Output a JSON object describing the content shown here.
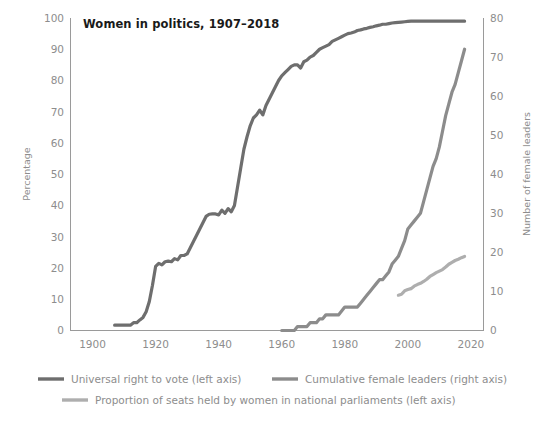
{
  "chart_data": {
    "type": "line",
    "title": "Women in politics, 1907–2018",
    "xlabel": "",
    "ylabel": "Percentage",
    "y2label": "Number of female leaders",
    "xlim": [
      1893,
      2024
    ],
    "ylim": [
      0,
      100
    ],
    "y2lim": [
      0,
      80
    ],
    "xticks": [
      1900,
      1920,
      1940,
      1960,
      1980,
      2000,
      2020
    ],
    "xtick_labels": [
      "1900",
      "1920",
      "1940",
      "1960",
      "1980",
      "2000",
      "2020"
    ],
    "yticks": [
      0,
      10,
      20,
      30,
      40,
      50,
      60,
      70,
      80,
      90,
      100
    ],
    "ytick_labels": [
      "0",
      "10",
      "20",
      "30",
      "40",
      "50",
      "60",
      "70",
      "80",
      "90",
      "100"
    ],
    "y2ticks": [
      0,
      10,
      20,
      30,
      40,
      50,
      60,
      70,
      80
    ],
    "y2tick_labels": [
      "0",
      "10",
      "20",
      "30",
      "40",
      "50",
      "60",
      "70",
      "80"
    ],
    "grid": false,
    "legend_position": "bottom",
    "series": [
      {
        "name": "Universal right to vote (left axis)",
        "axis": "left",
        "color": "#6e6e6e",
        "unit": "percent",
        "x": [
          1907,
          1908,
          1909,
          1910,
          1911,
          1912,
          1913,
          1914,
          1915,
          1916,
          1917,
          1918,
          1919,
          1920,
          1921,
          1922,
          1923,
          1924,
          1925,
          1926,
          1927,
          1928,
          1929,
          1930,
          1931,
          1932,
          1933,
          1934,
          1935,
          1936,
          1937,
          1938,
          1939,
          1940,
          1941,
          1942,
          1943,
          1944,
          1945,
          1946,
          1947,
          1948,
          1949,
          1950,
          1951,
          1952,
          1953,
          1954,
          1955,
          1956,
          1957,
          1958,
          1959,
          1960,
          1961,
          1962,
          1963,
          1964,
          1965,
          1966,
          1967,
          1968,
          1969,
          1970,
          1971,
          1972,
          1973,
          1974,
          1975,
          1976,
          1977,
          1978,
          1979,
          1980,
          1981,
          1982,
          1983,
          1984,
          1985,
          1986,
          1987,
          1988,
          1989,
          1990,
          1991,
          1992,
          1993,
          1994,
          1995,
          1996,
          1997,
          1998,
          1999,
          2000,
          2001,
          2002,
          2003,
          2004,
          2005,
          2006,
          2007,
          2008,
          2009,
          2010,
          2011,
          2012,
          2013,
          2014,
          2015,
          2016,
          2017,
          2018
        ],
        "y": [
          1.7,
          1.7,
          1.7,
          1.7,
          1.7,
          1.7,
          2.5,
          2.5,
          3.4,
          4.2,
          6.0,
          9.3,
          14.5,
          20.5,
          21.5,
          21.0,
          22.0,
          22.2,
          22.0,
          23.0,
          22.6,
          24.0,
          24.0,
          24.5,
          26.5,
          28.5,
          30.5,
          32.5,
          34.5,
          36.5,
          37.2,
          37.3,
          37.3,
          37.0,
          38.5,
          37.5,
          39.0,
          38.0,
          40.0,
          46.0,
          52.0,
          58.0,
          62.0,
          65.5,
          68.0,
          69.0,
          70.5,
          69.0,
          72.0,
          74.0,
          76.0,
          78.0,
          80.0,
          81.5,
          82.5,
          83.5,
          84.5,
          85.0,
          85.0,
          84.0,
          86.0,
          86.5,
          87.5,
          88.0,
          89.0,
          90.0,
          90.5,
          91.0,
          91.5,
          92.5,
          93.0,
          93.5,
          94.0,
          94.5,
          95.0,
          95.2,
          95.5,
          96.0,
          96.2,
          96.5,
          96.7,
          97.0,
          97.2,
          97.5,
          97.7,
          98.0,
          98.0,
          98.2,
          98.4,
          98.5,
          98.6,
          98.7,
          98.8,
          98.9,
          99.0,
          99.0,
          99.0,
          99.0,
          99.0,
          99.0,
          99.0,
          99.0,
          99.0,
          99.0,
          99.0,
          99.0,
          99.0,
          99.0,
          99.0,
          99.0,
          99.0,
          99.0
        ]
      },
      {
        "name": "Cumulative female leaders (right axis)",
        "axis": "right",
        "color": "#8c8c8c",
        "unit": "count",
        "x": [
          1960,
          1961,
          1962,
          1963,
          1964,
          1965,
          1966,
          1967,
          1968,
          1969,
          1970,
          1971,
          1972,
          1973,
          1974,
          1975,
          1976,
          1977,
          1978,
          1979,
          1980,
          1981,
          1982,
          1983,
          1984,
          1985,
          1986,
          1987,
          1988,
          1989,
          1990,
          1991,
          1992,
          1993,
          1994,
          1995,
          1996,
          1997,
          1998,
          1999,
          2000,
          2001,
          2002,
          2003,
          2004,
          2005,
          2006,
          2007,
          2008,
          2009,
          2010,
          2011,
          2012,
          2013,
          2014,
          2015,
          2016,
          2017,
          2018
        ],
        "y": [
          0,
          0,
          0,
          0,
          0,
          1,
          1,
          1,
          1,
          2,
          2,
          2,
          3,
          3,
          4,
          4,
          4,
          4,
          4,
          5,
          6,
          6,
          6,
          6,
          6,
          7,
          8,
          9,
          10,
          11,
          12,
          13,
          13,
          14,
          15,
          17,
          18,
          19,
          21,
          23,
          26,
          27,
          28,
          29,
          30,
          33,
          36,
          39,
          42,
          44,
          47,
          51,
          55,
          58,
          61,
          63,
          66,
          69,
          72
        ]
      },
      {
        "name": "Proportion of seats held by women in national parliaments (left axis)",
        "axis": "left",
        "color": "#aeaeae",
        "unit": "percent",
        "x": [
          1997,
          1998,
          1999,
          2000,
          2001,
          2002,
          2003,
          2004,
          2005,
          2006,
          2007,
          2008,
          2009,
          2010,
          2011,
          2012,
          2013,
          2014,
          2015,
          2016,
          2017,
          2018
        ],
        "y": [
          11.3,
          11.6,
          12.7,
          13.1,
          13.4,
          14.2,
          14.7,
          15.1,
          15.7,
          16.4,
          17.3,
          17.9,
          18.5,
          19.0,
          19.5,
          20.3,
          21.2,
          21.8,
          22.4,
          22.8,
          23.3,
          23.7
        ]
      }
    ]
  },
  "legend": {
    "items": [
      {
        "label": "Universal right to vote (left axis)",
        "color": "#6e6e6e"
      },
      {
        "label": "Cumulative female leaders (right axis)",
        "color": "#8c8c8c"
      },
      {
        "label": "Proportion of seats held by women in national parliaments (left axis)",
        "color": "#aeaeae"
      }
    ]
  },
  "colors": {
    "axis": "#9a9a9a",
    "tick_text": "#8d8d8d",
    "title_text": "#1a1a1a",
    "background": "#ffffff"
  }
}
